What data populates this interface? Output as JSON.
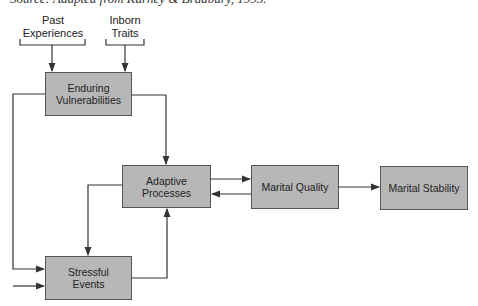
{
  "caption": "Source: Adapted from Karney & Bradbury, 1995.",
  "inputs": {
    "past_experiences": {
      "line1": "Past",
      "line2": "Experiences"
    },
    "inborn_traits": {
      "line1": "Inborn",
      "line2": "Traits"
    }
  },
  "nodes": {
    "enduring_vulnerabilities": {
      "line1": "Enduring",
      "line2": "Vulnerabilities"
    },
    "adaptive_processes": {
      "line1": "Adaptive",
      "line2": "Processes"
    },
    "stressful_events": {
      "line1": "Stressful",
      "line2": "Events"
    },
    "marital_quality": {
      "label": "Marital Quality"
    },
    "marital_stability": {
      "label": "Marital Stability"
    }
  },
  "colors": {
    "box_fill": "#b7b7b7",
    "box_border": "#555555",
    "line": "#333333"
  }
}
